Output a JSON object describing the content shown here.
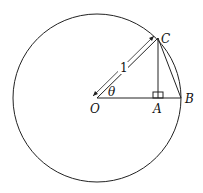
{
  "diagram": {
    "type": "unit-circle-geometry",
    "labels": {
      "O": "O",
      "A": "A",
      "B": "B",
      "C": "C",
      "theta": "θ",
      "radius": "1"
    },
    "points": {
      "O": [
        97,
        98
      ],
      "A": [
        158,
        98
      ],
      "B": [
        181,
        98
      ],
      "C": [
        158,
        38
      ]
    },
    "circle": {
      "cx": 97,
      "cy": 98,
      "r": 84
    },
    "stroke_color": "#222222"
  }
}
